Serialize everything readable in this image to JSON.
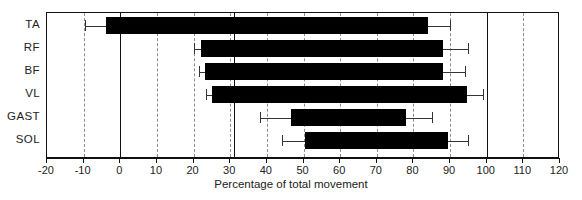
{
  "chart_data": {
    "type": "bar",
    "orientation": "horizontal",
    "title": "",
    "xlabel": "Percentage of total movement",
    "ylabel": "",
    "xlim": [
      -20,
      120
    ],
    "ylim": null,
    "xticks": [
      -20,
      -10,
      0,
      10,
      20,
      30,
      40,
      50,
      60,
      70,
      80,
      90,
      100,
      110,
      120
    ],
    "xtick_labels": [
      "-20",
      "-10",
      "0",
      "10",
      "20",
      "30",
      "40",
      "50",
      "60",
      "70",
      "80",
      "90",
      "100",
      "110",
      "120"
    ],
    "grid": "vertical dashed gridlines at every 10 units",
    "reference_lines": [
      0,
      31,
      100
    ],
    "legend": null,
    "categories": [
      "TA",
      "RF",
      "BF",
      "VL",
      "GAST",
      "SOL"
    ],
    "series": [
      {
        "name": "Mean onset-to-offset range (% of total movement)",
        "bars": [
          {
            "category": "TA",
            "start": -4,
            "end": 84,
            "err_low": -9.5,
            "err_high": 90
          },
          {
            "category": "RF",
            "start": 22,
            "end": 88,
            "err_low": 20,
            "err_high": 95
          },
          {
            "category": "BF",
            "start": 23,
            "end": 88,
            "err_low": 21.5,
            "err_high": 94
          },
          {
            "category": "VL",
            "start": 25,
            "end": 94.5,
            "err_low": 23.5,
            "err_high": 99
          },
          {
            "category": "GAST",
            "start": 46.5,
            "end": 78,
            "err_low": 38,
            "err_high": 85
          },
          {
            "category": "SOL",
            "start": 50.5,
            "end": 89.5,
            "err_low": 44,
            "err_high": 95
          }
        ]
      }
    ]
  },
  "axis": {
    "x_title": "Percentage of total movement"
  },
  "y_labels": [
    "TA",
    "RF",
    "BF",
    "VL",
    "GAST",
    "SOL"
  ],
  "x_tick_labels": [
    "-20",
    "-10",
    "0",
    "10",
    "20",
    "30",
    "40",
    "50",
    "60",
    "70",
    "80",
    "90",
    "100",
    "110",
    "120"
  ],
  "colors": {
    "bar": "#000000",
    "frame": "#111111",
    "grid": "#8d8d8d",
    "background": "#ffffff",
    "text": "#222222"
  }
}
